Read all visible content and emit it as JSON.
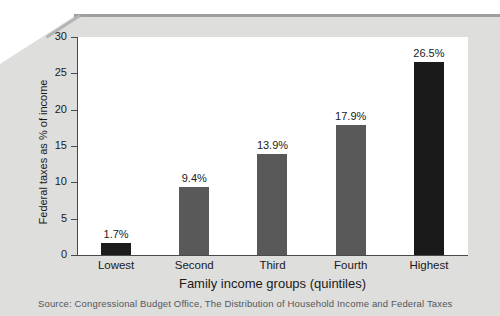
{
  "figure": {
    "source_note": "Source: Congressional Budget Office, The Distribution of Household Income and Federal Taxes"
  },
  "chart_data": {
    "type": "bar",
    "title": "",
    "xlabel": "Family income groups (quintiles)",
    "ylabel": "Federal taxes as % of income",
    "categories": [
      "Lowest",
      "Second",
      "Third",
      "Fourth",
      "Highest"
    ],
    "values": [
      1.7,
      9.4,
      13.9,
      17.9,
      26.5
    ],
    "value_labels": [
      "1.7%",
      "9.4%",
      "13.9%",
      "17.9%",
      "26.5%"
    ],
    "bar_colors": [
      "#1c1c1c",
      "#595959",
      "#595959",
      "#595959",
      "#1a1a1a"
    ],
    "ylim": [
      0,
      30
    ],
    "yticks": [
      0,
      5,
      10,
      15,
      20,
      25,
      30
    ],
    "ytick_labels": [
      "0",
      "5",
      "10",
      "15",
      "20",
      "25",
      "30"
    ],
    "grid": false,
    "legend": "none"
  }
}
